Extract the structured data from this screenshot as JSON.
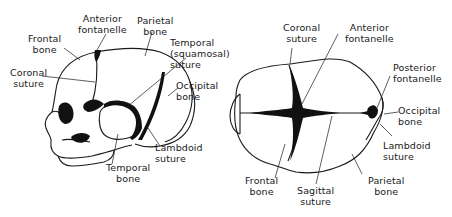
{
  "figure": {
    "lateral_view": {
      "labels": {
        "frontal_bone": [
          "Frontal",
          "bone"
        ],
        "anterior_fontanelle": [
          "Anterior",
          "fontanelle"
        ],
        "parietal_bone": [
          "Parietal",
          "bone"
        ],
        "temporal_squamosal_suture": [
          "Temporal",
          "(squamosal)",
          "suture"
        ],
        "coronal_suture": [
          "Coronal",
          "suture"
        ],
        "occipital_bone": [
          "Occipital",
          "bone"
        ],
        "lambdoid_suture": [
          "Lambdoid",
          "suture"
        ],
        "temporal_bone": [
          "Temporal",
          "bone"
        ]
      }
    },
    "superior_view": {
      "labels": {
        "coronal_suture": [
          "Coronal",
          "suture"
        ],
        "anterior_fontanelle": [
          "Anterior",
          "fontanelle"
        ],
        "posterior_fontanelle": [
          "Posterior",
          "fontanelle"
        ],
        "occipital_bone": [
          "Occipital",
          "bone"
        ],
        "lambdoid_suture": [
          "Lambdoid",
          "suture"
        ],
        "frontal_bone": [
          "Frontal",
          "bone"
        ],
        "sagittal_suture": [
          "Sagittal",
          "suture"
        ],
        "parietal_bone": [
          "Parietal",
          "bone"
        ]
      }
    },
    "colors": {
      "line": "#1a1a1a",
      "fill_dark": "#111111",
      "background": "#ffffff"
    }
  }
}
